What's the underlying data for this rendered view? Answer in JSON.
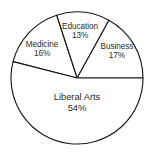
{
  "chart_data": {
    "type": "pie",
    "title": "",
    "subtitle": "",
    "xlabel": "",
    "ylabel": "",
    "legend": "none",
    "grid": false,
    "labels_inside_slices": true,
    "start_angle_deg": 0,
    "direction": "counterclockwise",
    "categories": [
      "Business",
      "Education",
      "Medicine",
      "Liberal Arts"
    ],
    "values": [
      17,
      13,
      16,
      54
    ],
    "units": "percent",
    "slices": [
      {
        "name": "Business",
        "value": 17,
        "value_label": "17%",
        "start_deg": 0,
        "end_deg": 61.2,
        "label_x": 117,
        "label_y": 51,
        "fill": "#ffffff",
        "stroke": "#1a1a1a"
      },
      {
        "name": "Education",
        "value": 13,
        "value_label": "13%",
        "start_deg": 61.2,
        "end_deg": 108.0,
        "label_x": 80,
        "label_y": 31,
        "fill": "#ffffff",
        "stroke": "#1a1a1a"
      },
      {
        "name": "Medicine",
        "value": 16,
        "value_label": "16%",
        "start_deg": 108.0,
        "end_deg": 165.6,
        "label_x": 42,
        "label_y": 49,
        "fill": "#ffffff",
        "stroke": "#1a1a1a"
      },
      {
        "name": "Liberal Arts",
        "value": 54,
        "value_label": "54%",
        "start_deg": 165.6,
        "end_deg": 360.0,
        "label_x": 77,
        "label_y": 102,
        "fill": "#ffffff",
        "stroke": "#1a1a1a"
      }
    ],
    "geometry": {
      "center_x": 77,
      "center_y": 78,
      "radius": 66
    }
  },
  "colors": {
    "background": "#ffffff",
    "outline": "#1a1a1a",
    "text": "#2b2b2b"
  }
}
